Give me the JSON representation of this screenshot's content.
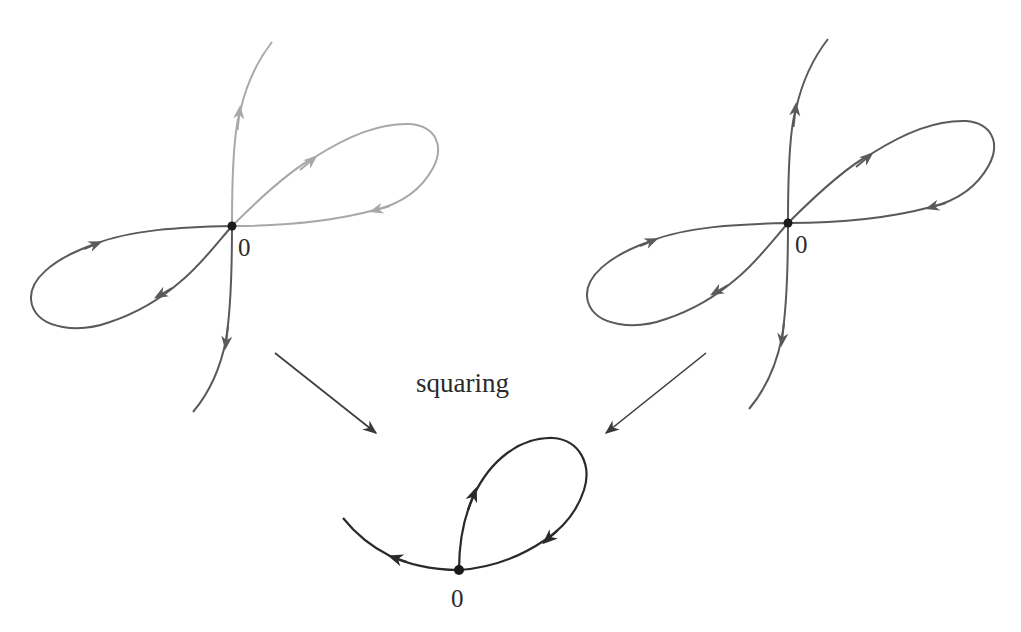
{
  "diagram": {
    "type": "curve-mapping",
    "caption": "squaring",
    "colors": {
      "dark_curve": "#5a5a5a",
      "light_curve": "#a8a8a8",
      "result_curve": "#2a2a2a",
      "point": "#1a1a1a",
      "arrow": "#3a3a3a"
    },
    "figures": [
      {
        "id": "left-figure-eight",
        "origin_label": "0",
        "description": "figure-eight curve through origin; upper branch and right loop drawn in light gray, lower branch and left loop drawn in dark gray"
      },
      {
        "id": "right-figure-eight",
        "origin_label": "0",
        "description": "figure-eight curve through origin, all drawn in dark gray"
      },
      {
        "id": "squared-result",
        "origin_label": "0",
        "description": "image under squaring: a single loop through origin plus a tail"
      }
    ],
    "mapping_arrows": [
      {
        "from": "left-figure-eight",
        "to": "squared-result"
      },
      {
        "from": "right-figure-eight",
        "to": "squared-result"
      }
    ]
  }
}
